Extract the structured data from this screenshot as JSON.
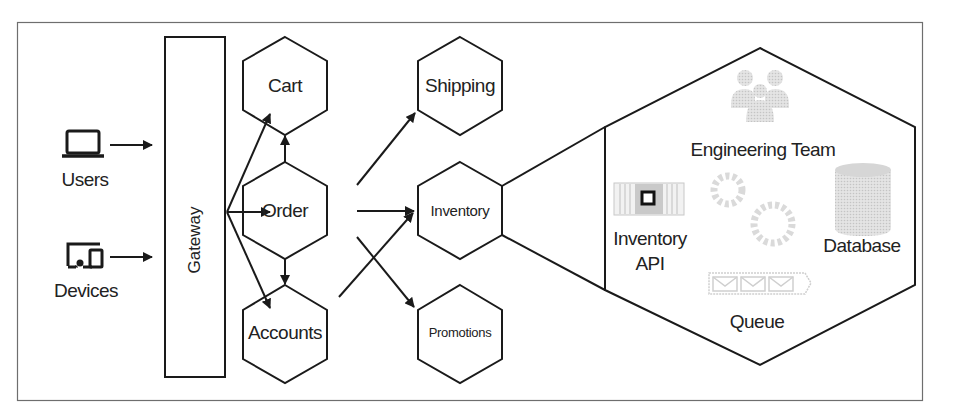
{
  "diagram": {
    "type": "microservices-architecture",
    "clients": [
      {
        "id": "users",
        "label": "Users",
        "icon": "laptop-icon"
      },
      {
        "id": "devices",
        "label": "Devices",
        "icon": "devices-icon"
      }
    ],
    "gateway": {
      "label": "Gateway"
    },
    "services": {
      "cart": {
        "label": "Cart"
      },
      "order": {
        "label": "Order"
      },
      "accounts": {
        "label": "Accounts"
      },
      "shipping": {
        "label": "Shipping"
      },
      "inventory": {
        "label": "Inventory"
      },
      "promotions": {
        "label": "Promotions"
      }
    },
    "inventory_detail": {
      "team": {
        "label": "Engineering Team",
        "icon": "team-icon"
      },
      "api": {
        "label_line1": "Inventory",
        "label_line2": "API",
        "icon": "api-icon"
      },
      "database": {
        "label": "Database",
        "icon": "database-icon"
      },
      "queue": {
        "label": "Queue",
        "icon": "queue-icon"
      },
      "processing": {
        "icon": "gears-icon"
      }
    },
    "edges": [
      {
        "from": "users",
        "to": "gateway"
      },
      {
        "from": "devices",
        "to": "gateway"
      },
      {
        "from": "gateway",
        "to": "cart"
      },
      {
        "from": "gateway",
        "to": "order"
      },
      {
        "from": "gateway",
        "to": "accounts"
      },
      {
        "from": "order",
        "to": "cart"
      },
      {
        "from": "order",
        "to": "accounts"
      },
      {
        "from": "order",
        "to": "shipping"
      },
      {
        "from": "order",
        "to": "inventory"
      },
      {
        "from": "order",
        "to": "promotions"
      },
      {
        "from": "accounts",
        "to": "inventory"
      }
    ],
    "colors": {
      "stroke": "#1a1a1a",
      "frame": "#6e6e6e",
      "icon_faded": "#c8c8c8",
      "background": "#ffffff"
    }
  }
}
